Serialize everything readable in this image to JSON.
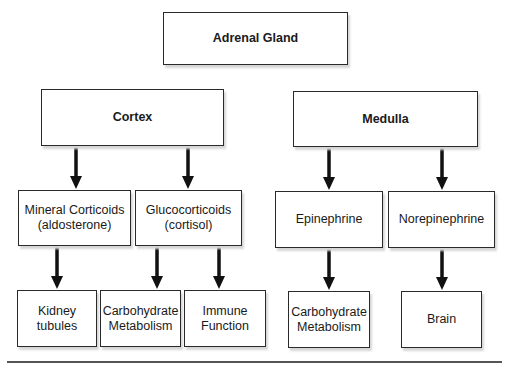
{
  "diagram": {
    "root": {
      "label": "Adrenal Gland"
    },
    "level1": [
      {
        "label": "Cortex"
      },
      {
        "label": "Medulla"
      }
    ],
    "level2": [
      {
        "label": "Mineral Corticoids\n(aldosterone)",
        "parent": "Cortex"
      },
      {
        "label": "Glucocorticoids\n(cortisol)",
        "parent": "Cortex"
      },
      {
        "label": "Epinephrine",
        "parent": "Medulla"
      },
      {
        "label": "Norepinephrine",
        "parent": "Medulla"
      }
    ],
    "level3": [
      {
        "label": "Kidney\ntubules",
        "parent": "Mineral Corticoids"
      },
      {
        "label": "Carbohydrate\nMetabolism",
        "parent": "Glucocorticoids"
      },
      {
        "label": "Immune\nFunction",
        "parent": "Glucocorticoids"
      },
      {
        "label": "Carbohydrate\nMetabolism",
        "parent": "Epinephrine"
      },
      {
        "label": "Brain",
        "parent": "Norepinephrine"
      }
    ]
  }
}
